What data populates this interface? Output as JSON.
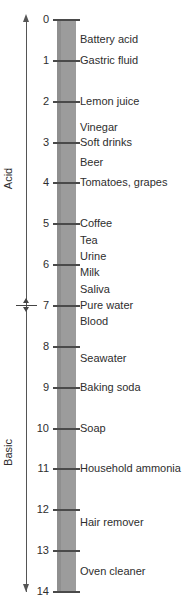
{
  "diagram": {
    "type": "ph-scale"
  },
  "axis": {
    "min": 0,
    "max": 14,
    "tick_labels": [
      "0",
      "1",
      "2",
      "3",
      "4",
      "5",
      "6",
      "7",
      "8",
      "9",
      "10",
      "11",
      "12",
      "13",
      "14"
    ],
    "neutral_value": 7,
    "bar_color": "#9c9c9c",
    "tick_color": "#4a4a4a",
    "text_color": "#2e2e2e"
  },
  "regions": {
    "acid_label": "Acid",
    "basic_label": "Basic"
  },
  "substances": [
    {
      "label": "Battery acid",
      "ph": 0.5
    },
    {
      "label": "Gastric fluid",
      "ph": 1
    },
    {
      "label": "Lemon juice",
      "ph": 2
    },
    {
      "label": "Vinegar",
      "ph": 2.65
    },
    {
      "label": "Soft drinks",
      "ph": 3
    },
    {
      "label": "Beer",
      "ph": 3.5
    },
    {
      "label": "Tomatoes, grapes",
      "ph": 4
    },
    {
      "label": "Coffee",
      "ph": 5
    },
    {
      "label": "Tea",
      "ph": 5.4
    },
    {
      "label": "Urine",
      "ph": 5.8
    },
    {
      "label": "Milk",
      "ph": 6.2
    },
    {
      "label": "Saliva",
      "ph": 6.6
    },
    {
      "label": "Pure water",
      "ph": 7
    },
    {
      "label": "Blood",
      "ph": 7.4
    },
    {
      "label": "Seawater",
      "ph": 8.3
    },
    {
      "label": "Baking soda",
      "ph": 9
    },
    {
      "label": "Soap",
      "ph": 10
    },
    {
      "label": "Household ammonia",
      "ph": 11
    },
    {
      "label": "Hair remover",
      "ph": 12.3
    },
    {
      "label": "Oven cleaner",
      "ph": 13.5
    }
  ],
  "chart_data": {
    "type": "scatter",
    "xlabel": "",
    "ylabel": "pH",
    "ylim": [
      0,
      14
    ],
    "grid": false,
    "legend": "none",
    "axis_direction": "top-to-bottom (0 at top, 14 at bottom)",
    "tick_values": [
      0,
      1,
      2,
      3,
      4,
      5,
      6,
      7,
      8,
      9,
      10,
      11,
      12,
      13,
      14
    ],
    "tick_labels": [
      "0",
      "1",
      "2",
      "3",
      "4",
      "5",
      "6",
      "7",
      "8",
      "9",
      "10",
      "11",
      "12",
      "13",
      "14"
    ],
    "annotations": [
      {
        "text": "Acid",
        "range": [
          0,
          7
        ]
      },
      {
        "text": "Basic",
        "range": [
          7,
          14
        ]
      },
      {
        "text": "neutral marker",
        "value": 7
      }
    ],
    "categories": [
      "Battery acid",
      "Gastric fluid",
      "Lemon juice",
      "Vinegar",
      "Soft drinks",
      "Beer",
      "Tomatoes, grapes",
      "Coffee",
      "Tea",
      "Urine",
      "Milk",
      "Saliva",
      "Pure water",
      "Blood",
      "Seawater",
      "Baking soda",
      "Soap",
      "Household ammonia",
      "Hair remover",
      "Oven cleaner"
    ],
    "values": [
      0.5,
      1,
      2,
      2.65,
      3,
      3.5,
      4,
      5,
      5.4,
      5.8,
      6.2,
      6.6,
      7,
      7.4,
      8.3,
      9,
      10,
      11,
      12.3,
      13.5
    ]
  }
}
